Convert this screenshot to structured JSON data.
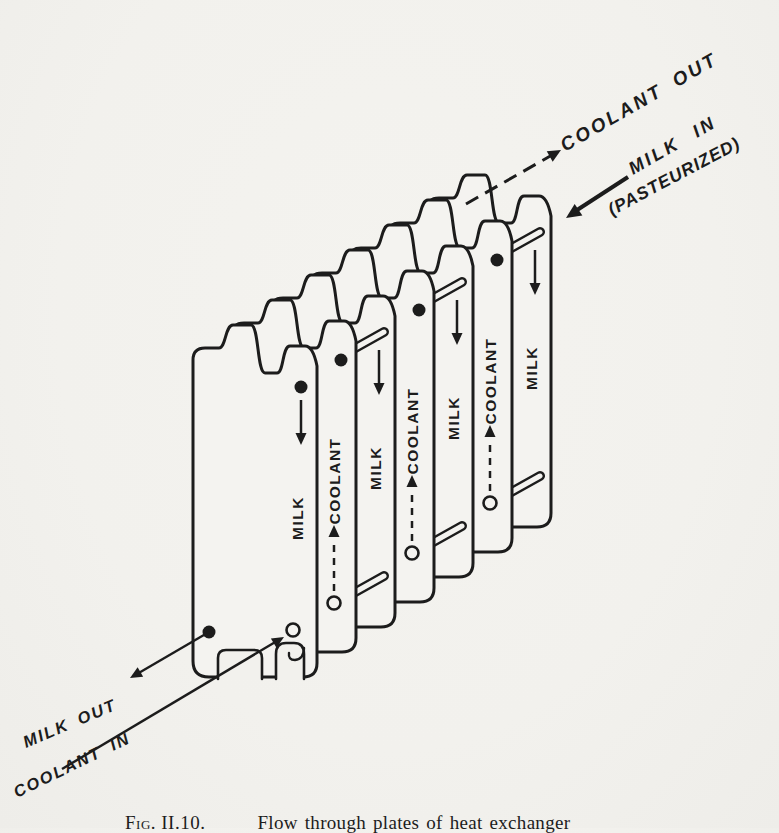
{
  "colors": {
    "paper": "#f2f1ed",
    "ink": "#1c1c1c"
  },
  "figure": {
    "caption_label": "Fig. II.10.",
    "caption_text": "Flow through plates of heat exchanger"
  },
  "annotations": {
    "coolant_out": "COOLANT OUT",
    "milk_in": "MILK IN",
    "milk_in_note": "(PASTEURIZED)",
    "milk_out": "MILK OUT",
    "coolant_in": "COOLANT IN"
  },
  "plates": [
    {
      "label": "MILK",
      "type": "milk",
      "flow": "down",
      "top_port": true,
      "outlet_port": true,
      "inlet_port": true
    },
    {
      "label": "COOLANT",
      "type": "coolant",
      "flow": "up",
      "top_port": true,
      "outlet_port": false,
      "inlet_port": false
    },
    {
      "label": "MILK",
      "type": "milk",
      "flow": "down",
      "top_port": false,
      "outlet_port": false,
      "inlet_port": false
    },
    {
      "label": "COOLANT",
      "type": "coolant",
      "flow": "up",
      "top_port": true,
      "outlet_port": false,
      "inlet_port": false
    },
    {
      "label": "MILK",
      "type": "milk",
      "flow": "down",
      "top_port": false,
      "outlet_port": false,
      "inlet_port": false
    },
    {
      "label": "COOLANT",
      "type": "coolant",
      "flow": "up",
      "top_port": true,
      "outlet_port": false,
      "inlet_port": false
    },
    {
      "label": "MILK",
      "type": "milk",
      "flow": "down",
      "top_port": false,
      "outlet_port": false,
      "inlet_port": false
    }
  ]
}
